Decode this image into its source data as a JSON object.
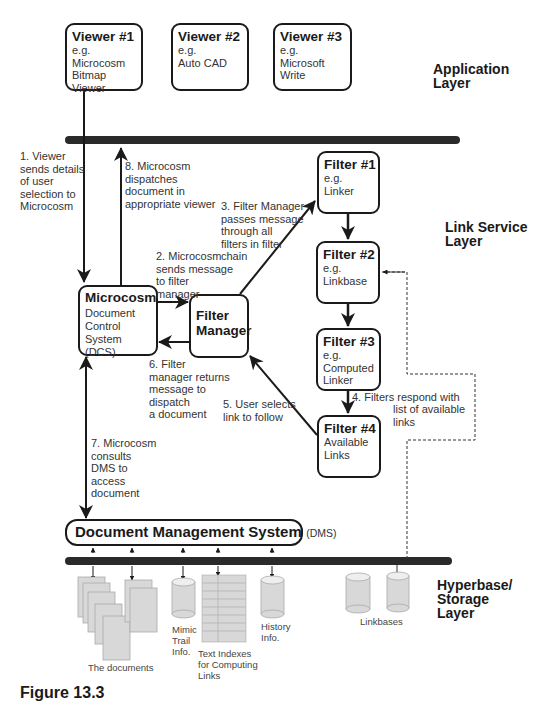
{
  "layers": {
    "application": "Application\nLayer",
    "link_service": "Link Service\nLayer",
    "storage": "Hyperbase/\nStorage\nLayer"
  },
  "viewers": [
    {
      "title": "Viewer #1",
      "desc": "e.g.\nMicrocosm\nBitmap Viewer"
    },
    {
      "title": "Viewer #2",
      "desc": "e.g.\nAuto CAD"
    },
    {
      "title": "Viewer #3",
      "desc": "e.g.\nMicrosoft\nWrite"
    }
  ],
  "filters": [
    {
      "title": "Filter #1",
      "desc": "e.g.\nLinker"
    },
    {
      "title": "Filter #2",
      "desc": "e.g.\nLinkbase"
    },
    {
      "title": "Filter #3",
      "desc": "e.g.\nComputed\nLinker"
    },
    {
      "title": "Filter #4",
      "desc": "Available\nLinks"
    }
  ],
  "microcosm": {
    "title": "Microcosm",
    "desc": "Document\nControl\nSystem (DCS)"
  },
  "filter_manager": {
    "title": "Filter\nManager"
  },
  "dms": {
    "title": "Document Management System",
    "abbr": "(DMS)"
  },
  "steps": {
    "s1": "1. Viewer\nsends details\nof user\nselection to\nMicrocosm",
    "s2": "2. Microcosm\nsends message\nto filter\nmanager",
    "s3": "3. Filter Manager\npasses message\nthrough all\nfilters in filter\nchain",
    "s4a": "4. Filters respond with",
    "s4b": "list of available\nlinks",
    "s5": "5. User selects\nlink to follow",
    "s6": "6. Filter\nmanager returns\nmessage to\ndispatch\na document",
    "s7": "7. Microcosm\nconsults\nDMS to\naccess\ndocument",
    "s8": "8. Microcosm\ndispatches\ndocument in\nappropriate viewer"
  },
  "storage_items": {
    "documents": "The documents",
    "mimic": "Mimic\nTrail\nInfo.",
    "text_indexes": "Text Indexes\nfor Computing\nLinks",
    "history": "History\nInfo.",
    "linkbases": "Linkbases"
  },
  "caption": "Figure 13.3"
}
